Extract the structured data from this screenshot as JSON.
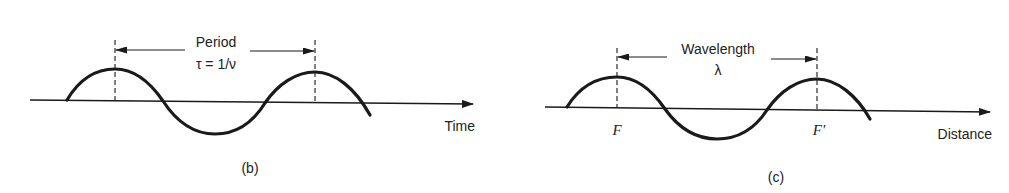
{
  "figure": {
    "colors": {
      "ink": "#1a1a1a",
      "text": "#222222",
      "background": "#ffffff"
    },
    "panels": [
      {
        "id": "b",
        "caption": "(b)",
        "axis_label": "Time",
        "span_label_line1": "Period",
        "span_label_line2": "τ = 1/ν",
        "point_labels": []
      },
      {
        "id": "c",
        "caption": "(c)",
        "axis_label": "Distance",
        "span_label_line1": "Wavelength",
        "span_label_line2": "λ",
        "point_labels": [
          "F",
          "F′"
        ]
      }
    ]
  }
}
